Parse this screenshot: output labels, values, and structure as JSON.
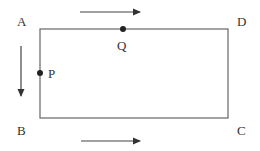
{
  "diagram": {
    "type": "rectangle-with-points-and-direction-arrows",
    "stroke_color": "#555555",
    "text_color": "#333333",
    "corners": {
      "top_left": "A",
      "bottom_left": "B",
      "bottom_right": "C",
      "top_right": "D"
    },
    "points": {
      "on_left_side": "P",
      "on_top_side": "Q"
    },
    "arrows": [
      {
        "position": "above top side",
        "direction": "right"
      },
      {
        "position": "left of left side",
        "direction": "down"
      },
      {
        "position": "below bottom side",
        "direction": "right"
      }
    ]
  }
}
